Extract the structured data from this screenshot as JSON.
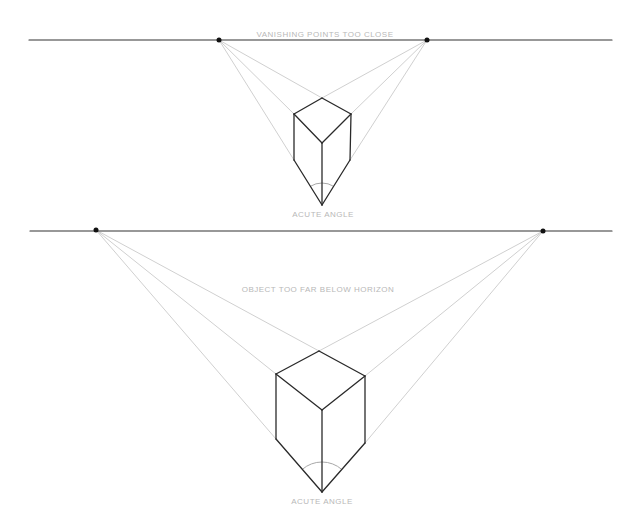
{
  "colors": {
    "horizon": "#333333",
    "edge": "#2a2a2a",
    "construction": "#d0d0d0",
    "label": "#b8b8b8",
    "vanishing_point": "#111111"
  },
  "panels": [
    {
      "caption": "VANISHING POINTS TOO CLOSE",
      "angle_label": "ACUTE ANGLE",
      "horizon": {
        "x1": 29,
        "x2": 612,
        "y": 40
      },
      "vanishing_points": [
        {
          "x": 219,
          "y": 40
        },
        {
          "x": 427,
          "y": 40
        }
      ],
      "box": {
        "top": [
          322,
          98
        ],
        "left": [
          294,
          114
        ],
        "right": [
          351,
          114
        ],
        "center": [
          322,
          143
        ],
        "bottom_left": [
          294,
          160
        ],
        "bottom_right": [
          350,
          160
        ],
        "bottom": [
          322,
          205
        ]
      },
      "caption_pos": {
        "x": 325,
        "y": 30
      },
      "angle_label_pos": {
        "x": 323,
        "y": 210
      }
    },
    {
      "caption": "OBJECT TOO FAR BELOW HORIZON",
      "angle_label": "ACUTE ANGLE",
      "horizon": {
        "x1": 30,
        "x2": 612,
        "y": 231
      },
      "vanishing_points": [
        {
          "x": 96,
          "y": 230
        },
        {
          "x": 543,
          "y": 231
        }
      ],
      "box": {
        "top": [
          319,
          351
        ],
        "left": [
          276,
          374
        ],
        "right": [
          365,
          376
        ],
        "center": [
          322,
          410
        ],
        "bottom_left": [
          276,
          439
        ],
        "bottom_right": [
          365,
          443
        ],
        "bottom": [
          322,
          492
        ]
      },
      "caption_pos": {
        "x": 318,
        "y": 285
      },
      "angle_label_pos": {
        "x": 322,
        "y": 497
      }
    }
  ]
}
